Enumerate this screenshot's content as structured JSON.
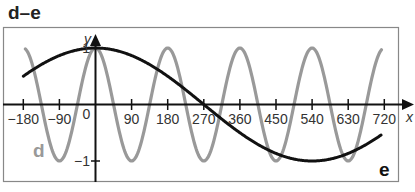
{
  "panel": {
    "title": "d–e"
  },
  "chart_data": {
    "type": "line",
    "title": "d–e",
    "xlabel": "x",
    "ylabel": "y",
    "xlim": [
      -180,
      720
    ],
    "ylim": [
      -1,
      1
    ],
    "x_ticks": [
      -180,
      -90,
      0,
      90,
      180,
      270,
      360,
      450,
      540,
      630,
      720
    ],
    "x_tick_labels": [
      "−180",
      "−90",
      "0",
      "90",
      "180",
      "270",
      "360",
      "450",
      "540",
      "630",
      "720"
    ],
    "y_ticks": [
      1,
      -1
    ],
    "y_tick_labels": [
      "1",
      "−1"
    ],
    "grid": false,
    "legend": "inline labels",
    "series": [
      {
        "name": "d",
        "function": "y = cos(2x)",
        "color": "#999999",
        "x": [
          -180,
          -135,
          -90,
          -45,
          0,
          45,
          90,
          135,
          180,
          225,
          270,
          315,
          360,
          405,
          450,
          495,
          540,
          585,
          630,
          675,
          720
        ],
        "values": [
          1,
          0,
          -1,
          0,
          1,
          0,
          -1,
          0,
          1,
          0,
          -1,
          0,
          1,
          0,
          -1,
          0,
          1,
          0,
          -1,
          0,
          1
        ]
      },
      {
        "name": "e",
        "function": "y = cos(x/3)",
        "color": "#111111",
        "x": [
          -180,
          -90,
          0,
          90,
          180,
          270,
          360,
          450,
          540,
          630,
          720
        ],
        "values": [
          0.5,
          0.87,
          1,
          0.87,
          0.5,
          0,
          -0.5,
          -0.87,
          -1,
          -0.87,
          -0.5
        ]
      }
    ]
  }
}
